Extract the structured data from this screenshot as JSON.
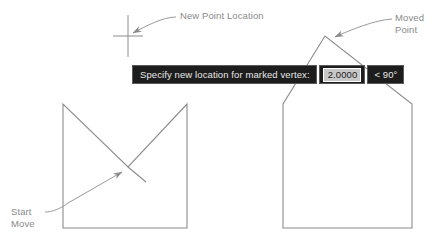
{
  "annotations": {
    "new_point_location": "New Point Location",
    "moved_point": "Moved\nPoint",
    "start_move": "Start\nMove"
  },
  "dynamic_input": {
    "prompt": "Specify new location for marked vertex:",
    "value": "2.0000",
    "angle": "< 90°"
  },
  "colors": {
    "geometry_stroke": "#8c8c8c",
    "leader_stroke": "#9a9a9a",
    "label_text": "#8a8a8a",
    "prompt_background": "#1d1d1d",
    "prompt_text": "#e8e8e8",
    "value_background": "#c8c8c8",
    "value_text": "#1d1d1d",
    "page_background": "#ffffff"
  },
  "figure": {
    "type": "cad-vertex-move-illustration",
    "left_shape": {
      "name": "original-profile",
      "description": "rectangle with V notch cut from top edge down to interior vertex",
      "points": [
        [
          63,
          104
        ],
        [
          63,
          228
        ],
        [
          187,
          228
        ],
        [
          187,
          104
        ],
        [
          128,
          167
        ],
        [
          63,
          104
        ]
      ]
    },
    "right_shape": {
      "name": "modified-profile",
      "description": "pentagon house outline after vertex moved upward above the top edge",
      "points": [
        [
          283,
          104
        ],
        [
          283,
          228
        ],
        [
          412,
          228
        ],
        [
          412,
          104
        ],
        [
          325,
          36
        ],
        [
          283,
          104
        ]
      ]
    },
    "cursor": {
      "name": "crosshair-cursor",
      "vertical_line": [
        [
          128,
          15
        ],
        [
          128,
          57
        ]
      ],
      "horizontal_tick": [
        [
          113,
          36
        ],
        [
          143,
          36
        ]
      ]
    },
    "leaders": [
      {
        "name": "leader-new-point-location",
        "from": [
          176,
          17
        ],
        "to": [
          130,
          34
        ],
        "arrow_at": "to"
      },
      {
        "name": "leader-moved-point",
        "from": [
          392,
          19
        ],
        "to": [
          330,
          38
        ],
        "arrow_at": "to"
      },
      {
        "name": "leader-start-move",
        "from": [
          45,
          212
        ],
        "to": [
          127,
          168
        ],
        "arrow_at": "to"
      }
    ],
    "vertex_stub": {
      "name": "vertex-stub-segment",
      "from": [
        128,
        167
      ],
      "to": [
        146,
        182
      ]
    }
  }
}
